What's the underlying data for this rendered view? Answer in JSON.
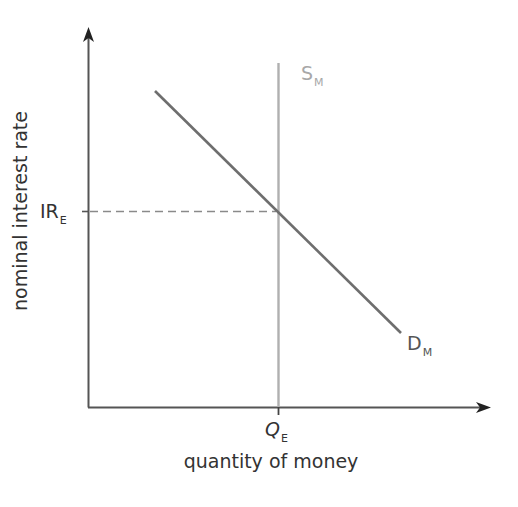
{
  "diagram": {
    "x_axis": {
      "label": "quantity of money",
      "equilibrium_tick": {
        "main": "Q",
        "sub": "E"
      }
    },
    "y_axis": {
      "label": "nominal interest rate",
      "equilibrium_tick": {
        "main": "IR",
        "sub": "E"
      }
    },
    "curves": [
      {
        "id": "supply",
        "main": "S",
        "sub": "M",
        "type": "vertical",
        "color": "#b0b0b0"
      },
      {
        "id": "demand",
        "main": "D",
        "sub": "M",
        "type": "downward-sloping",
        "color": "#6e6e6e"
      }
    ],
    "colors": {
      "axes": "#333333",
      "supply": "#b0b0b0",
      "demand": "#6e6e6e",
      "guide": "#8a8a8a",
      "text": "#333333"
    }
  }
}
